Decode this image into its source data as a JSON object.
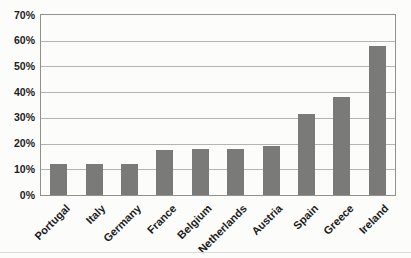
{
  "chart_data": {
    "type": "bar",
    "title": "",
    "xlabel": "",
    "ylabel": "",
    "categories": [
      "Portugal",
      "Italy",
      "Germany",
      "France",
      "Belgium",
      "Netherlands",
      "Austria",
      "Spain",
      "Greece",
      "Ireland"
    ],
    "values": [
      12,
      12,
      12,
      17.5,
      18,
      18,
      19,
      31.5,
      38,
      58
    ],
    "ylim": [
      0,
      70
    ],
    "y_tick_step": 10,
    "y_tick_labels": [
      "0%",
      "10%",
      "20%",
      "30%",
      "40%",
      "50%",
      "60%",
      "70%"
    ],
    "grid": true,
    "legend": false,
    "colors": {
      "bar": "#7a7a78",
      "gridline": "#b4b4b0",
      "plot_border": "#90908c",
      "label_text": "#1b1b1b",
      "background": "#fcfcfa"
    }
  }
}
